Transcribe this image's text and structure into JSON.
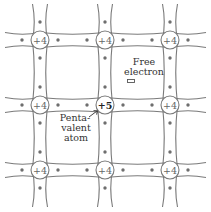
{
  "diagram": {
    "grid": {
      "xs": [
        40,
        105,
        170
      ],
      "ys": [
        40,
        105,
        170
      ]
    },
    "atoms": [
      {
        "row": 0,
        "col": 0,
        "label": "+4",
        "type": "host"
      },
      {
        "row": 0,
        "col": 1,
        "label": "+4",
        "type": "host"
      },
      {
        "row": 0,
        "col": 2,
        "label": "+4",
        "type": "host"
      },
      {
        "row": 1,
        "col": 0,
        "label": "+4",
        "type": "host"
      },
      {
        "row": 1,
        "col": 1,
        "label": "+5",
        "type": "dopant"
      },
      {
        "row": 1,
        "col": 2,
        "label": "+4",
        "type": "host"
      },
      {
        "row": 2,
        "col": 0,
        "label": "+4",
        "type": "host"
      },
      {
        "row": 2,
        "col": 1,
        "label": "+4",
        "type": "host"
      },
      {
        "row": 2,
        "col": 2,
        "label": "+4",
        "type": "host"
      }
    ],
    "labels": {
      "free_electron_line1": "Free",
      "free_electron_line2": "electron",
      "pentavalent_line1": "Penta-",
      "pentavalent_line2": "valent",
      "pentavalent_line3": "atom"
    },
    "colors": {
      "bond": "#7a7a7a",
      "electron": "#6e6e6e",
      "text": "#333333",
      "dopant_label": "#222222"
    }
  }
}
